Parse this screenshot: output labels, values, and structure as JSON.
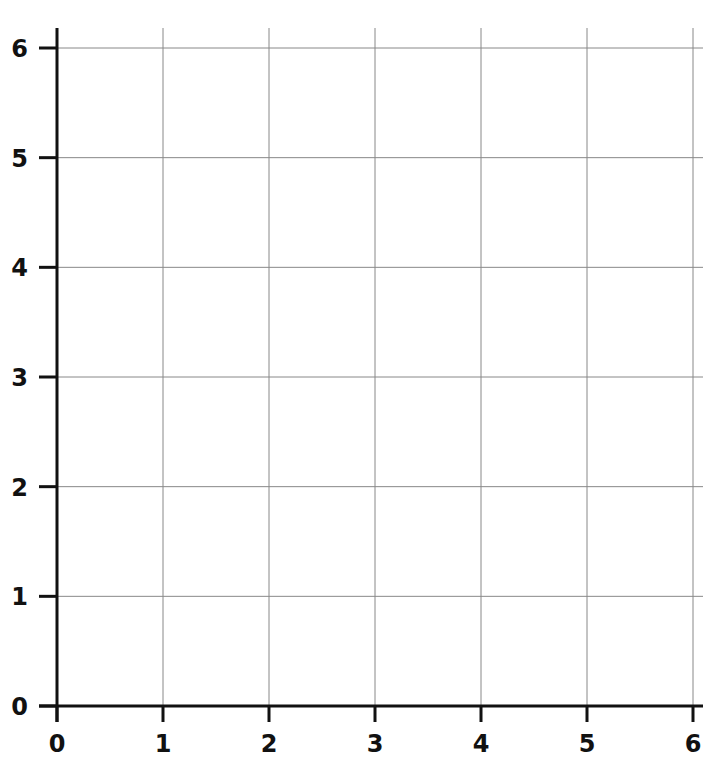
{
  "chart_data": {
    "type": "scatter",
    "title": "",
    "xlabel": "",
    "ylabel": "",
    "xlim": [
      0,
      6
    ],
    "ylim": [
      0,
      6
    ],
    "x_ticks": [
      "0",
      "1",
      "2",
      "3",
      "4",
      "5",
      "6"
    ],
    "y_ticks": [
      "0",
      "1",
      "2",
      "3",
      "4",
      "5",
      "6"
    ],
    "grid": true,
    "series": [],
    "note": "Blank coordinate grid, first quadrant, no data plotted"
  },
  "colors": {
    "axis": "#111111",
    "grid": "#888888",
    "background": "#ffffff"
  }
}
